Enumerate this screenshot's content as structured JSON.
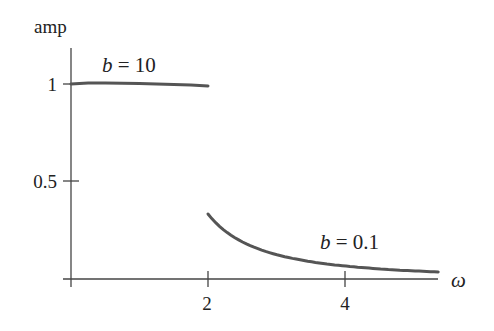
{
  "chart_data": {
    "type": "line",
    "title": "",
    "xlabel": "ω",
    "ylabel": "amp",
    "xlim": [
      0,
      5.36
    ],
    "ylim": [
      0,
      1.1
    ],
    "grid": false,
    "x_ticks": [
      {
        "value": 2,
        "label": "2"
      },
      {
        "value": 4,
        "label": "4"
      }
    ],
    "y_ticks": [
      {
        "value": 0.5,
        "label": "0.5"
      },
      {
        "value": 1,
        "label": "1"
      }
    ],
    "series": [
      {
        "name": "b = 10",
        "label_var": "b",
        "label_value": "= 10",
        "x": [
          0,
          0.25,
          0.5,
          0.75,
          1.0,
          1.25,
          1.5,
          1.75,
          2.0
        ],
        "values": [
          1.0,
          1.005,
          1.005,
          1.004,
          1.002,
          1.0,
          0.998,
          0.995,
          0.99
        ],
        "color": "#555555"
      },
      {
        "name": "b = 0.1",
        "label_var": "b",
        "label_value": "= 0.1",
        "x": [
          2.0,
          2.25,
          2.5,
          2.75,
          3.0,
          3.25,
          3.5,
          3.75,
          4.0,
          4.25,
          4.5,
          4.75,
          5.0,
          5.25,
          5.36
        ],
        "values": [
          0.333,
          0.246,
          0.19,
          0.152,
          0.125,
          0.105,
          0.089,
          0.077,
          0.067,
          0.059,
          0.052,
          0.047,
          0.042,
          0.038,
          0.036
        ],
        "color": "#555555"
      }
    ],
    "annotations": [
      {
        "text": "b = 10",
        "x": 0.45,
        "y": 1.1
      },
      {
        "text": "b = 0.1",
        "x": 4.0,
        "y": 0.17
      }
    ]
  },
  "labels": {
    "ylabel": "amp",
    "xlabel": "ω",
    "xtick_2": "2",
    "xtick_4": "4",
    "ytick_05": "0.5",
    "ytick_1": "1",
    "series0_var": "b",
    "series0_rest": " = 10",
    "series1_var": "b",
    "series1_rest": " = 0.1"
  },
  "colors": {
    "curve": "#555555",
    "axis": "#444444",
    "text": "#222222"
  }
}
